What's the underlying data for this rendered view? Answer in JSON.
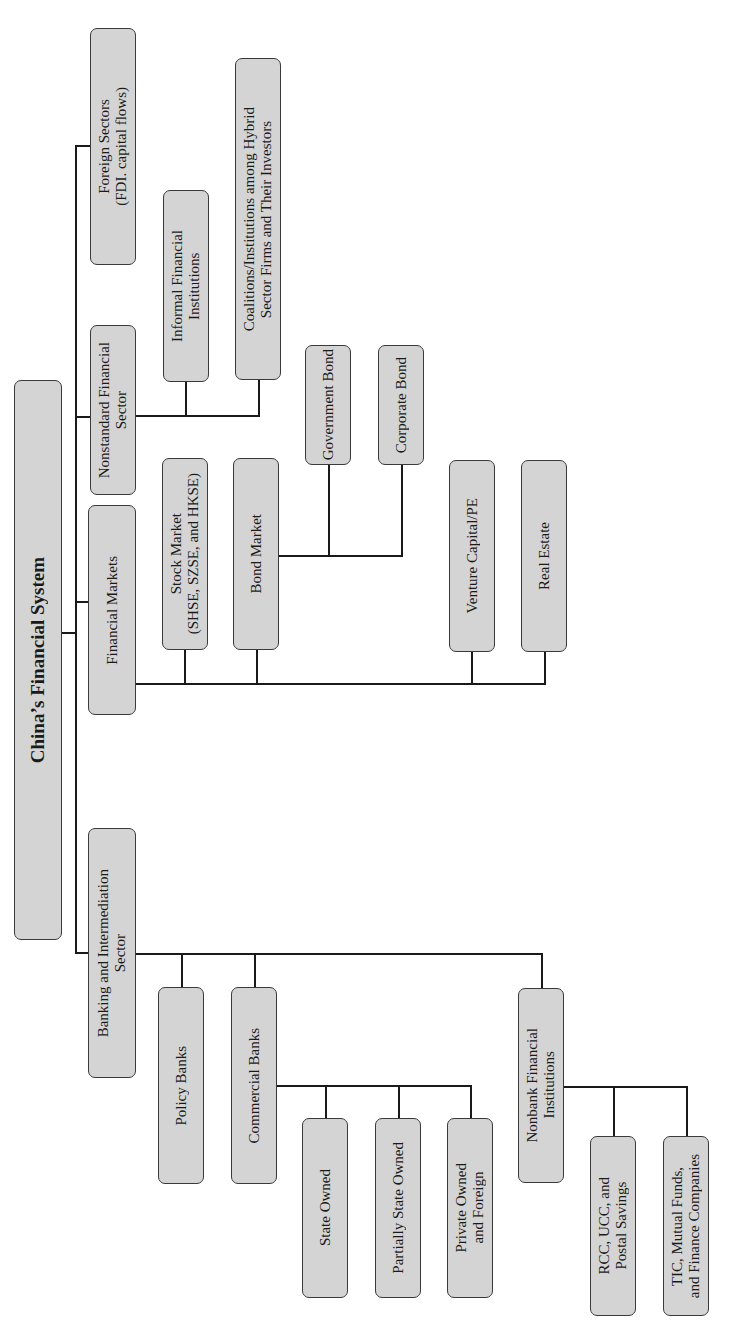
{
  "diagram": {
    "root": {
      "label": "China’s Financial System"
    },
    "level1": {
      "banking": {
        "label": "Banking and Intermediation\nSector"
      },
      "markets": {
        "label": "Financial Markets"
      },
      "nonstandard": {
        "label": "Nonstandard Financial\nSector"
      },
      "foreign": {
        "label": "Foreign Sectors\n(FDI. capital flows)"
      }
    },
    "banking_children": {
      "policy": {
        "label": "Policy Banks"
      },
      "commercial": {
        "label": "Commercial Banks"
      },
      "nonbank": {
        "label": "Nonbank Financial\nInstitutions"
      }
    },
    "commercial_children": {
      "state": {
        "label": "State Owned"
      },
      "partial": {
        "label": "Partially State Owned"
      },
      "private": {
        "label": "Private Owned\nand Foreign"
      }
    },
    "nonbank_children": {
      "rcc": {
        "label": "RCC, UCC, and\nPostal Savings"
      },
      "tic": {
        "label": "TIC, Mutual Funds,\nand Finance Companies"
      }
    },
    "markets_children": {
      "stock": {
        "label": "Stock Market\n(SHSE, SZSE, and HKSE)"
      },
      "bond": {
        "label": "Bond Market"
      },
      "venture": {
        "label": "Venture Capital/PE"
      },
      "realestate": {
        "label": "Real Estate"
      }
    },
    "bond_children": {
      "government": {
        "label": "Government Bond"
      },
      "corporate": {
        "label": "Corporate Bond"
      }
    },
    "nonstandard_children": {
      "informal": {
        "label": "Informal Financial\nInstitutions"
      },
      "coalitions": {
        "label": "Coalitions/Institutions among Hybrid\nSector Firms and Their Investors"
      }
    },
    "colors": {
      "box_fill": "#d4d4d4",
      "box_border": "#3a3a3a",
      "connector": "#1a1a1a",
      "background": "#ffffff"
    }
  }
}
